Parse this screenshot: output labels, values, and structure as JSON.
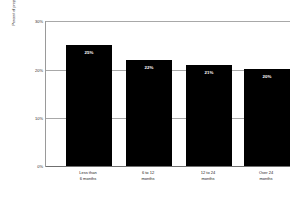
{
  "chart_data": {
    "type": "bar",
    "title": "",
    "xlabel": "",
    "ylabel": "Percent of project FTE dedicated to CM",
    "ylim": [
      0,
      30
    ],
    "grid": true,
    "legend": "none",
    "categories": [
      "Less than 6 months",
      "6 to 12 months",
      "12 to 24 months",
      "Over 24 months"
    ],
    "category_lines": [
      [
        "Less than",
        "6 months"
      ],
      [
        "6 to 12",
        "months"
      ],
      [
        "12 to 24",
        "months"
      ],
      [
        "Over 24",
        "months"
      ]
    ],
    "values": [
      25,
      22,
      21,
      20
    ],
    "value_labels": [
      "25%",
      "22%",
      "21%",
      "20%"
    ],
    "ytick_values": [
      0,
      10,
      20,
      30
    ],
    "ytick_labels": [
      "0%",
      "10%",
      "20%",
      "30%"
    ],
    "bar_color": "#000000",
    "grid_color": "#a8a8a8",
    "axis_color": "#6f6f6f",
    "label_text_color": "#ffffff",
    "background": "#ffffff"
  }
}
